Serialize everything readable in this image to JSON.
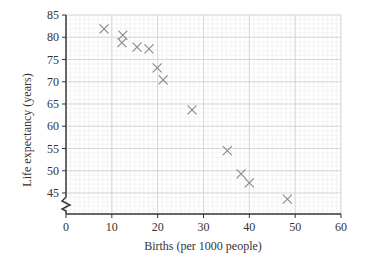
{
  "chart_data": {
    "type": "scatter",
    "title": "",
    "xlabel": "Births (per 1000 people)",
    "ylabel": "Life expectancy (years)",
    "xlim": [
      0,
      60
    ],
    "ylim": [
      45,
      85
    ],
    "y_axis_break": true,
    "x_ticks": [
      0,
      10,
      20,
      30,
      40,
      50,
      60
    ],
    "y_ticks": [
      45,
      50,
      55,
      60,
      65,
      70,
      75,
      80,
      85
    ],
    "grid": {
      "major_x": 10,
      "major_y": 5,
      "minor": 1
    },
    "marker": "x",
    "series": [
      {
        "name": "Countries",
        "points": [
          {
            "x": 8.3,
            "y": 81.9
          },
          {
            "x": 12.4,
            "y": 80.5
          },
          {
            "x": 12.2,
            "y": 78.8
          },
          {
            "x": 15.5,
            "y": 77.8
          },
          {
            "x": 18.1,
            "y": 77.4
          },
          {
            "x": 19.9,
            "y": 73.1
          },
          {
            "x": 21.2,
            "y": 70.4
          },
          {
            "x": 27.5,
            "y": 63.7
          },
          {
            "x": 35.2,
            "y": 54.5
          },
          {
            "x": 38.2,
            "y": 49.3
          },
          {
            "x": 40.0,
            "y": 47.3
          },
          {
            "x": 48.3,
            "y": 43.6
          }
        ]
      }
    ],
    "colors": {
      "marker": "#8a8a8a",
      "axis": "#333333",
      "major_grid": "#cfcfcf",
      "minor_grid": "#ececec"
    }
  }
}
